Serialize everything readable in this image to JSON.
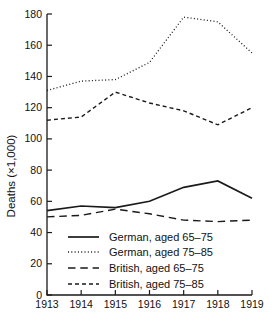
{
  "figure": {
    "background": "#ffffff",
    "text_color": "#111111"
  },
  "chart_data": {
    "type": "line",
    "title": "",
    "xlabel": "",
    "ylabel": "Deaths (×1,000)",
    "x": [
      1913,
      1914,
      1915,
      1916,
      1917,
      1918,
      1919
    ],
    "x_tick_labels": [
      "1913",
      "1914",
      "1915",
      "1916",
      "1917",
      "1918",
      "1919"
    ],
    "y_ticks": [
      0,
      20,
      40,
      60,
      80,
      100,
      120,
      140,
      160,
      180
    ],
    "ylim": [
      0,
      180
    ],
    "grid": false,
    "legend_position": "inside-bottom-left",
    "line_color": "#1a1a1a",
    "series": [
      {
        "name": "German, aged 65–75",
        "style": "solid",
        "values": [
          54,
          57,
          56,
          60,
          69,
          73,
          62
        ]
      },
      {
        "name": "German, aged 75–85",
        "style": "dotted",
        "values": [
          131,
          137,
          138,
          149,
          178,
          175,
          155
        ]
      },
      {
        "name": "British, aged 65–75",
        "style": "long-dash",
        "values": [
          50,
          51,
          55,
          52,
          48,
          47,
          48
        ]
      },
      {
        "name": "British, aged 75–85",
        "style": "short-dash",
        "values": [
          112,
          114,
          130,
          123,
          118,
          109,
          120
        ]
      }
    ]
  }
}
